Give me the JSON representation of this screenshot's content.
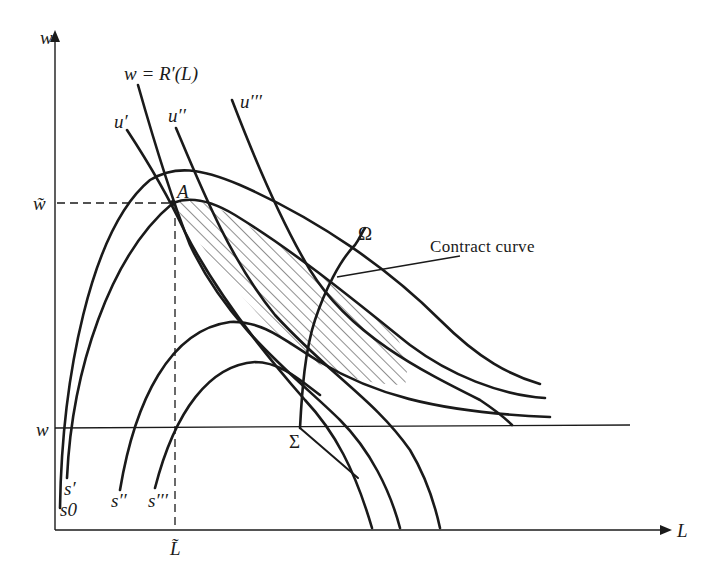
{
  "figure": {
    "axes": {
      "y_label": "w",
      "x_label": "L"
    },
    "reference_levels": {
      "w_tilde_label": "w̃",
      "w_label": "w",
      "L_tilde_label": "L̃"
    },
    "points": {
      "A": "A",
      "Omega": "Ω",
      "Sigma": "Σ"
    },
    "curves": {
      "labor_demand": "w = R′(L)",
      "indifference": [
        "u′",
        "u′′",
        "u′′′"
      ],
      "isoprofit": [
        "s0",
        "s′",
        "s′′",
        "s′′′"
      ]
    },
    "annotations": {
      "contract_curve": "Contract curve"
    },
    "colors": {
      "ink": "#1a1a1a",
      "background": "#ffffff"
    }
  }
}
